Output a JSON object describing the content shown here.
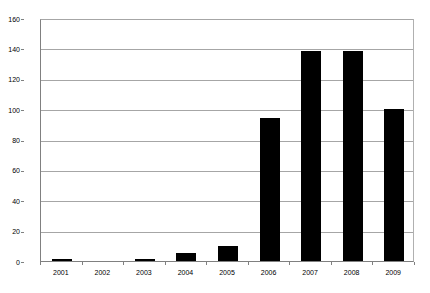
{
  "chart_data": {
    "type": "bar",
    "title": "",
    "subtitle": "",
    "xlabel": "",
    "ylabel": "",
    "categories": [
      "2001",
      "2002",
      "2003",
      "2004",
      "2005",
      "2006",
      "2007",
      "2008",
      "2009"
    ],
    "values": [
      1,
      0,
      1,
      5,
      10,
      94,
      138,
      138,
      100
    ],
    "series": [
      {
        "name": "",
        "values": [
          1,
          0,
          1,
          5,
          10,
          94,
          138,
          138,
          100
        ],
        "color": "#000000"
      }
    ],
    "ylim": [
      0,
      160
    ],
    "xlim": null,
    "ytick_labels": [
      "0",
      "20",
      "40",
      "60",
      "80",
      "100",
      "120",
      "140",
      "160"
    ],
    "ytick_values": [
      0,
      20,
      40,
      60,
      80,
      100,
      120,
      140,
      160
    ],
    "ytick_interval": 20,
    "xtick_labels": [
      "2001",
      "2002",
      "2003",
      "2004",
      "2005",
      "2006",
      "2007",
      "2008",
      "2009"
    ],
    "grid": "horizontal",
    "grid_color": "#a6a6a6",
    "legend": false,
    "legend_position": "none",
    "annotations": [],
    "plot_background": "#ffffff",
    "axis_color": "#808080",
    "data_labels": false
  }
}
